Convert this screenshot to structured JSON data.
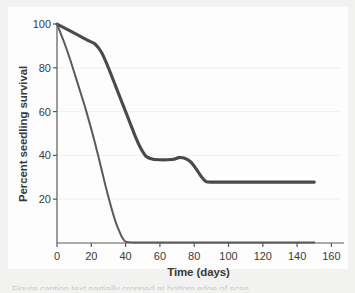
{
  "figure": {
    "background_color": "#f2f2f1",
    "panel_color": "#fdfdfd",
    "caption_fragment": "Figure caption text partially cropped at bottom edge of scan"
  },
  "chart_data": {
    "type": "line",
    "title": "",
    "xlabel": "Time (days)",
    "ylabel": "Percent seedling survival",
    "xlim": [
      0,
      165
    ],
    "ylim": [
      0,
      100
    ],
    "xticks": [
      0,
      20,
      40,
      60,
      80,
      100,
      120,
      140,
      160
    ],
    "xtick_labels": [
      "0",
      "20",
      "40",
      "60",
      "80",
      "100",
      "120",
      "140",
      "160"
    ],
    "yticks": [
      20,
      40,
      60,
      80,
      100
    ],
    "ytick_labels": [
      "20",
      "40",
      "60",
      "80",
      "100"
    ],
    "grid": {
      "horizontal": true,
      "vertical": false,
      "color": "#f0f0ef",
      "at": [
        20,
        40,
        60,
        80
      ]
    },
    "legend": {
      "visible": false,
      "position": "none"
    },
    "line_color_thick": "#4a4a4a",
    "line_color_thin": "#5a5a5a",
    "line_width_thick": 3.1,
    "line_width_thin": 2.0,
    "series": [
      {
        "name": "Upper survival curve (thick line)",
        "style": "thick",
        "color": "#4a4a4a",
        "x": [
          0,
          6,
          12,
          18,
          22,
          26,
          30,
          34,
          38,
          42,
          46,
          49,
          52,
          56,
          60,
          64,
          68,
          71,
          74,
          78,
          81,
          84,
          87,
          90,
          100,
          110,
          120,
          130,
          140,
          150
        ],
        "y": [
          100,
          97.5,
          95,
          92.5,
          91,
          87,
          80,
          72,
          64,
          56,
          48,
          43,
          39.5,
          38.2,
          38,
          38,
          38.2,
          39,
          38.8,
          37,
          34,
          30.5,
          28,
          27.8,
          27.8,
          27.8,
          27.8,
          27.8,
          27.8,
          27.8
        ]
      },
      {
        "name": "Lower survival curve (thin line)",
        "style": "thin",
        "color": "#5a5a5a",
        "x": [
          0,
          4,
          8,
          12,
          16,
          20,
          24,
          28,
          31,
          34,
          36,
          38,
          40,
          45,
          55,
          70,
          90,
          110,
          130,
          150
        ],
        "y": [
          100,
          92,
          83,
          73,
          63,
          52,
          40,
          27,
          18,
          10,
          6,
          2.5,
          0.6,
          0.2,
          0.2,
          0.2,
          0.2,
          0.2,
          0.2,
          0.2
        ]
      }
    ],
    "annotations": [
      {
        "text": "Thick curve plateaus near 38% between day 52 and day 75"
      },
      {
        "text": "Thick curve drops to a final plateau near 28% after day 87"
      },
      {
        "text": "Thin curve reaches zero survival by about day 40"
      }
    ],
    "axis": {
      "color": "#5a5a5a",
      "spines": [
        "left",
        "bottom"
      ],
      "tick_direction": "out"
    }
  }
}
